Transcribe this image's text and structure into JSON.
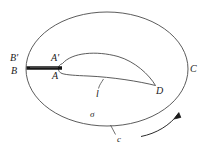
{
  "figure": {
    "type": "mathematical-diagram",
    "background_color": "#ffffff",
    "stroke_color": "#3a3a3a",
    "cut_color": "#111111"
  },
  "labels": {
    "b_prime": "B'",
    "b": "B",
    "a_prime": "A'",
    "a": "A",
    "c_upper": "C",
    "d": "D",
    "l": "l",
    "sigma": "σ",
    "c_lower": "c"
  },
  "elements": {
    "outer_contour_name": "closed contour c",
    "region_name": "region sigma",
    "profile_name": "airfoil profile l",
    "cut_name": "branch cut B-A / B'-A'",
    "arrow_name": "circulation direction arrow"
  },
  "geometry": {
    "ellipse_cx": 107,
    "ellipse_cy": 69,
    "ellipse_rx": 81,
    "ellipse_ry": 57,
    "cut_x_start": 27,
    "cut_x_end": 62,
    "cut_y": 68
  }
}
